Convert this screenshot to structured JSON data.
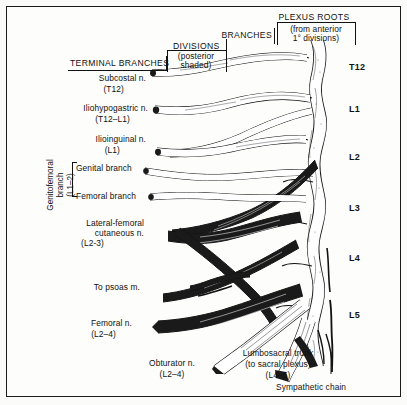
{
  "figure": {
    "title_region": {
      "plexus_roots": "PLEXUS ROOTS",
      "plexus_roots_sub_line1": "(from anterior",
      "plexus_roots_sub_line2": "1° divisions)",
      "branches": "BRANCHES",
      "divisions": "DIVISIONS",
      "divisions_sub_line1": "(posterior",
      "divisions_sub_line2": "shaded)",
      "terminal_branches": "TERMINAL BRANCHES"
    },
    "terminal_branch_labels": [
      {
        "name": "Subcostal n.",
        "roots": "(T12)"
      },
      {
        "name": "Iliohypogastric n.",
        "roots": "(T12–L1)"
      },
      {
        "name": "Ilioinguinal n.",
        "roots": "(L1)"
      },
      {
        "name": "Genital branch",
        "roots": ""
      },
      {
        "name": "Femoral branch",
        "roots": ""
      },
      {
        "name": "Lateral-femoral",
        "roots": ""
      },
      {
        "name": "cutaneous n.",
        "roots": "(L2-3)"
      },
      {
        "name": "To psoas m.",
        "roots": ""
      },
      {
        "name": "Femoral n.",
        "roots": "(L2–4)"
      }
    ],
    "genitofemoral": {
      "line1": "Genitofemoral",
      "line2": "branch",
      "line3": "(L1–2)"
    },
    "bottom_labels": {
      "obturator_name": "Obturator n.",
      "obturator_roots": "(L2–4)",
      "lumbosacral_line1": "Lumbosacral trunk",
      "lumbosacral_line2": "(to sacral plexus)",
      "lumbosacral_line3": "(L4–5)",
      "sympathetic_chain": "Sympathetic chain"
    },
    "vertebral_levels": [
      "T12",
      "L1",
      "L2",
      "L3",
      "L4",
      "L5"
    ],
    "colors": {
      "ink": "#111111",
      "paper": "#fdfdfb",
      "posterior_shade": "#1a1a1a",
      "anterior_light": "#ffffff"
    }
  }
}
